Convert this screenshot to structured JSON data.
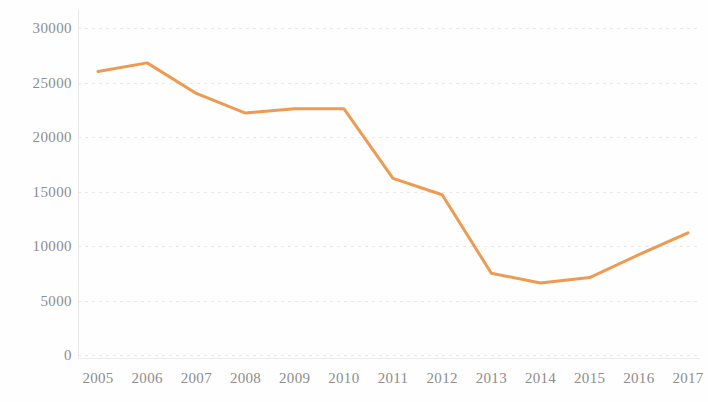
{
  "chart_data": {
    "type": "line",
    "title": "",
    "subtitle": "",
    "xlabel": "",
    "ylabel": "",
    "categories": [
      "2005",
      "2006",
      "2007",
      "2008",
      "2009",
      "2010",
      "2011",
      "2012",
      "2013",
      "2014",
      "2015",
      "2016",
      "2017"
    ],
    "values": [
      26000,
      26800,
      24000,
      22200,
      22600,
      22600,
      16200,
      14700,
      7500,
      6600,
      7100,
      9200,
      11200
    ],
    "series": [
      {
        "name": "",
        "values": [
          26000,
          26800,
          24000,
          22200,
          22600,
          22600,
          16200,
          14700,
          7500,
          6600,
          7100,
          9200,
          11200
        ]
      }
    ],
    "y_ticks": [
      0,
      5000,
      10000,
      15000,
      20000,
      25000,
      30000
    ],
    "y_tick_labels": [
      "0",
      "5000",
      "10000",
      "15000",
      "20000",
      "25000",
      "30000"
    ],
    "x_tick_labels": [
      "2005",
      "2006",
      "2007",
      "2008",
      "2009",
      "2010",
      "2011",
      "2012",
      "2013",
      "2014",
      "2015",
      "2016",
      "2017"
    ],
    "ylim": [
      0,
      30000
    ],
    "xlim": [
      "2005",
      "2017"
    ],
    "grid": true,
    "grid_axis": "y",
    "legend": false,
    "legend_position": "none",
    "line_color": "#ED9A52",
    "grid_color": "#E9E9EA",
    "axis_text_color": "#8D8D8D",
    "background_color": "#FEFEFE",
    "line_width": 3
  }
}
